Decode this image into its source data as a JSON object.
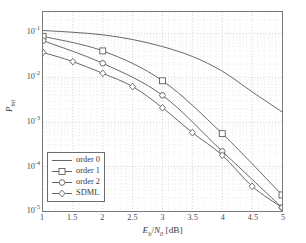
{
  "chart_data": {
    "type": "line",
    "title": "",
    "xlabel": "E_b/N_0 [dB]",
    "ylabel": "P_bit",
    "xlabel_parts": {
      "e": "E",
      "b": "b",
      "slash": "/",
      "n": "N",
      "zero": "0",
      "unit": " [dB]"
    },
    "ylabel_parts": {
      "p": "P",
      "sub": "bit"
    },
    "xscale": "linear",
    "yscale": "log",
    "xlim": [
      1,
      5
    ],
    "ylim": [
      1e-05,
      0.3
    ],
    "grid": true,
    "grid_style": "dotted",
    "legend_position": "lower left",
    "xticks": [
      1,
      1.5,
      2,
      2.5,
      3,
      3.5,
      4,
      4.5,
      5
    ],
    "xticklabels": [
      "1",
      "1.5",
      "2",
      "2.5",
      "3",
      "3.5",
      "4",
      "4.5",
      "5"
    ],
    "yticks": [
      0.1,
      0.01,
      0.001,
      0.0001,
      1e-05
    ],
    "yticklabels": [
      "10",
      "10",
      "10",
      "10",
      "10"
    ],
    "ytickexponents": [
      "-1",
      "-2",
      "-3",
      "-4",
      "-5"
    ],
    "series": [
      {
        "name": "order 0",
        "marker": "none",
        "color": "#555555",
        "x": [
          1,
          1.5,
          2,
          2.5,
          3,
          3.5,
          4,
          4.5,
          5
        ],
        "y": [
          0.115,
          0.105,
          0.092,
          0.072,
          0.05,
          0.03,
          0.014,
          0.0048,
          0.0017
        ]
      },
      {
        "name": "order 1",
        "marker": "square",
        "color": "#555555",
        "x": [
          1,
          2,
          3,
          4,
          5
        ],
        "y": [
          0.085,
          0.04,
          0.0085,
          0.00055,
          2.3e-05
        ]
      },
      {
        "name": "order 2",
        "marker": "hexagon",
        "color": "#555555",
        "x": [
          1,
          2,
          3,
          4,
          5
        ],
        "y": [
          0.068,
          0.021,
          0.004,
          0.00022,
          1.2e-05
        ]
      },
      {
        "name": "SDML",
        "marker": "diamond",
        "color": "#555555",
        "x": [
          1,
          1.5,
          2,
          2.5,
          3,
          3.5,
          4,
          4.5,
          5
        ],
        "y": [
          0.037,
          0.023,
          0.0125,
          0.0063,
          0.0021,
          0.00058,
          0.00018,
          3.6e-05,
          1.2e-05
        ]
      }
    ]
  },
  "legend": {
    "items": [
      {
        "label": "order 0",
        "marker": "none"
      },
      {
        "label": "order 1",
        "marker": "square"
      },
      {
        "label": "order 2",
        "marker": "hexagon"
      },
      {
        "label": "SDML",
        "marker": "diamond"
      }
    ]
  }
}
